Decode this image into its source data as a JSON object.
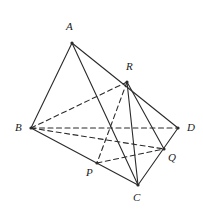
{
  "figure": {
    "width": 203,
    "height": 211,
    "background": "#ffffff",
    "stroke_color": "#2b2b2b",
    "stroke_width": 1.1,
    "dash_pattern": "5,3.5",
    "vertices": [
      {
        "id": "A",
        "label": "A",
        "x": 72,
        "y": 43,
        "label_x": 66,
        "label_y": 21,
        "dot": true
      },
      {
        "id": "B",
        "label": "B",
        "x": 31,
        "y": 128,
        "label_x": 15,
        "label_y": 122,
        "dot": true
      },
      {
        "id": "C",
        "label": "C",
        "x": 138,
        "y": 185,
        "label_x": 133,
        "label_y": 192,
        "dot": true
      },
      {
        "id": "D",
        "label": "D",
        "x": 178,
        "y": 128,
        "label_x": 187,
        "label_y": 122,
        "dot": true
      },
      {
        "id": "P",
        "label": "P",
        "x": 97,
        "y": 163,
        "label_x": 86,
        "label_y": 167,
        "dot": true
      },
      {
        "id": "Q",
        "label": "Q",
        "x": 164,
        "y": 149,
        "label_x": 168,
        "label_y": 152,
        "dot": true
      },
      {
        "id": "R",
        "label": "R",
        "x": 127,
        "y": 82,
        "label_x": 126,
        "label_y": 61,
        "dot": true
      }
    ],
    "solid_edges": [
      {
        "name": "edge-A-B",
        "from": "A",
        "to": "B"
      },
      {
        "name": "edge-A-D",
        "from": "A",
        "to": "D"
      },
      {
        "name": "edge-A-C",
        "from": "A",
        "to": "C"
      },
      {
        "name": "edge-B-C",
        "from": "B",
        "to": "C"
      },
      {
        "name": "edge-C-D",
        "from": "C",
        "to": "D"
      },
      {
        "name": "edge-R-C",
        "from": "R",
        "to": "C"
      },
      {
        "name": "edge-R-Q",
        "from": "R",
        "to": "Q"
      }
    ],
    "dashed_edges": [
      {
        "name": "edge-B-D",
        "from": "B",
        "to": "D"
      },
      {
        "name": "edge-B-R",
        "from": "B",
        "to": "R"
      },
      {
        "name": "edge-B-Q",
        "from": "B",
        "to": "Q"
      },
      {
        "name": "edge-P-Q",
        "from": "P",
        "to": "Q"
      },
      {
        "name": "edge-R-P",
        "from": "R",
        "to": "P"
      }
    ]
  }
}
